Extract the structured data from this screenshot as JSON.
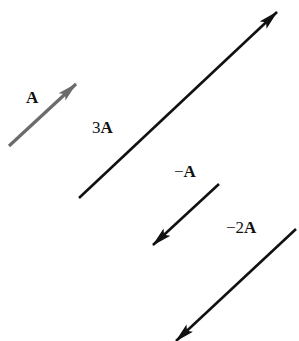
{
  "diagram": {
    "colors": {
      "background": "#ffffff",
      "vector_A": "#6b6b6b",
      "vectors_other": "#111111"
    },
    "vectors": [
      {
        "id": "A",
        "label_coef": "",
        "label_vec": "A",
        "scale": 1,
        "x1": 9,
        "y1": 146,
        "x2": 76,
        "y2": 84,
        "color": "#6b6b6b"
      },
      {
        "id": "3A",
        "label_coef": "3",
        "label_vec": "A",
        "scale": 3,
        "x1": 79,
        "y1": 198,
        "x2": 277,
        "y2": 12,
        "color": "#111111"
      },
      {
        "id": "-A",
        "label_coef": "−",
        "label_vec": "A",
        "scale": -1,
        "x1": 219,
        "y1": 184,
        "x2": 153,
        "y2": 245,
        "color": "#111111"
      },
      {
        "id": "-2A",
        "label_coef": "−2",
        "label_vec": "A",
        "scale": -2,
        "x1": 296,
        "y1": 229,
        "x2": 176,
        "y2": 341,
        "color": "#111111"
      }
    ]
  }
}
